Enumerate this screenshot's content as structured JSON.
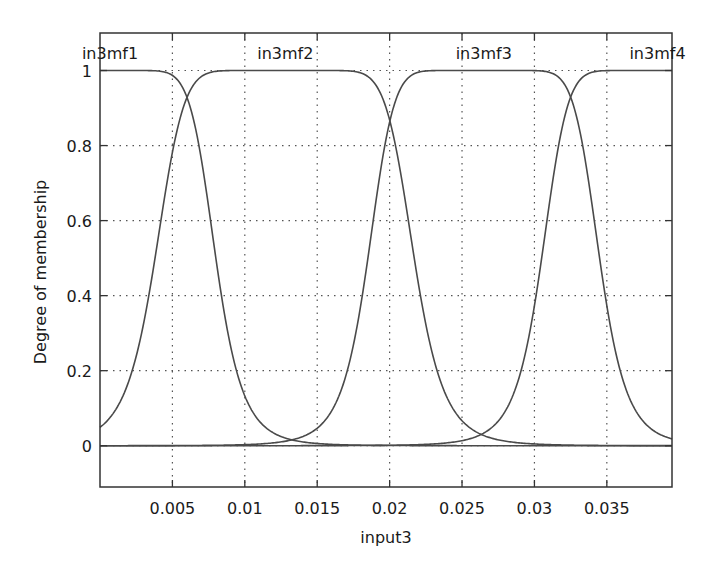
{
  "chart_data": {
    "type": "line",
    "title": "",
    "xlabel": "input3",
    "ylabel": "Degree of membership",
    "xlim": [
      0,
      0.0395
    ],
    "ylim": [
      -0.11,
      1.1
    ],
    "x_ticks": [
      0.005,
      0.01,
      0.015,
      0.02,
      0.025,
      0.03,
      0.035
    ],
    "x_tick_labels": [
      "0.005",
      "0.01",
      "0.015",
      "0.02",
      "0.025",
      "0.03",
      "0.035"
    ],
    "y_ticks": [
      0,
      0.2,
      0.4,
      0.6,
      0.8,
      1
    ],
    "y_tick_labels": [
      "0",
      "0.2",
      "0.4",
      "0.6",
      "0.8",
      "1"
    ],
    "grid": true,
    "grid_style": "dotted",
    "legend": "none (curve labels placed above each curve)",
    "line_color": "#4a4a4a",
    "series": [
      {
        "name": "in3mf1",
        "shape": "generalized bell",
        "center": 0.0,
        "half_width": 0.0065,
        "slope": 3.5,
        "label_x": 0.0,
        "plateau": [
          0.0,
          0.0015
        ],
        "points": [
          [
            0.0,
            1.0
          ],
          [
            0.0015,
            1.0
          ],
          [
            0.003,
            0.93
          ],
          [
            0.004,
            0.82
          ],
          [
            0.005,
            0.68
          ],
          [
            0.0065,
            0.5
          ],
          [
            0.008,
            0.34
          ],
          [
            0.01,
            0.18
          ],
          [
            0.012,
            0.1
          ],
          [
            0.015,
            0.05
          ],
          [
            0.02,
            0.02
          ],
          [
            0.03,
            0.006
          ],
          [
            0.0395,
            0.002
          ]
        ]
      },
      {
        "name": "in3mf2",
        "shape": "generalized bell",
        "center": 0.0128,
        "half_width": 0.0072,
        "slope": 3.5,
        "label_x": 0.0128,
        "plateau": [
          0.011,
          0.0145
        ],
        "points": [
          [
            0.0,
            0.06
          ],
          [
            0.002,
            0.1
          ],
          [
            0.004,
            0.18
          ],
          [
            0.006,
            0.42
          ],
          [
            0.008,
            0.75
          ],
          [
            0.01,
            0.95
          ],
          [
            0.011,
            1.0
          ],
          [
            0.0145,
            1.0
          ],
          [
            0.016,
            0.94
          ],
          [
            0.018,
            0.75
          ],
          [
            0.02,
            0.5
          ],
          [
            0.022,
            0.3
          ],
          [
            0.024,
            0.17
          ],
          [
            0.026,
            0.1
          ],
          [
            0.028,
            0.06
          ],
          [
            0.032,
            0.02
          ],
          [
            0.0395,
            0.004
          ]
        ]
      },
      {
        "name": "in3mf3",
        "shape": "generalized bell",
        "center": 0.0265,
        "half_width": 0.0065,
        "slope": 3.5,
        "label_x": 0.0265,
        "plateau": [
          0.025,
          0.028
        ],
        "points": [
          [
            0.0,
            0.002
          ],
          [
            0.008,
            0.01
          ],
          [
            0.012,
            0.03
          ],
          [
            0.015,
            0.06
          ],
          [
            0.017,
            0.12
          ],
          [
            0.019,
            0.3
          ],
          [
            0.02,
            0.5
          ],
          [
            0.022,
            0.76
          ],
          [
            0.024,
            0.96
          ],
          [
            0.025,
            1.0
          ],
          [
            0.028,
            1.0
          ],
          [
            0.03,
            0.9
          ],
          [
            0.032,
            0.65
          ],
          [
            0.033,
            0.5
          ],
          [
            0.035,
            0.27
          ],
          [
            0.037,
            0.15
          ],
          [
            0.0395,
            0.06
          ]
        ]
      },
      {
        "name": "in3mf4",
        "shape": "generalized bell",
        "center": 0.0395,
        "half_width": 0.0065,
        "slope": 3.5,
        "label_x": 0.0385,
        "plateau": [
          0.037,
          0.0395
        ],
        "points": [
          [
            0.0,
            0.001
          ],
          [
            0.015,
            0.004
          ],
          [
            0.02,
            0.01
          ],
          [
            0.025,
            0.03
          ],
          [
            0.028,
            0.06
          ],
          [
            0.03,
            0.11
          ],
          [
            0.032,
            0.3
          ],
          [
            0.033,
            0.5
          ],
          [
            0.034,
            0.65
          ],
          [
            0.035,
            0.8
          ],
          [
            0.036,
            0.93
          ],
          [
            0.037,
            1.0
          ],
          [
            0.0395,
            1.0
          ]
        ]
      }
    ]
  }
}
